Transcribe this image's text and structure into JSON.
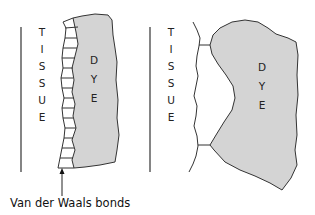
{
  "diagram": {
    "colors": {
      "dye_fill": "#d4d4d4",
      "stroke": "#333333",
      "background": "#ffffff"
    },
    "left_panel": {
      "tissue_label": [
        "T",
        "I",
        "S",
        "S",
        "U",
        "E"
      ],
      "dye_label": [
        "D",
        "Y",
        "E"
      ],
      "bond_type": "many parallel bonds along full interface"
    },
    "right_panel": {
      "tissue_label": [
        "T",
        "I",
        "S",
        "S",
        "U",
        "E"
      ],
      "dye_label": [
        "D",
        "Y",
        "E"
      ],
      "bond_type": "two bonds at contact points"
    },
    "annotation": {
      "text": "Van der Waals bonds",
      "arrow": "pointing up to bond region of left panel"
    }
  }
}
